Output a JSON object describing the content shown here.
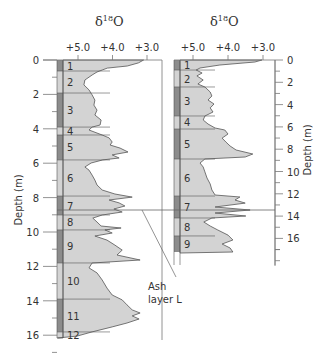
{
  "chart_data": [
    {
      "type": "area",
      "title": "δ18O",
      "xlabel": "δ18O",
      "ylabel": "Depth (m)",
      "x_ticks": [
        "+5.0",
        "+4.0",
        "+3.0"
      ],
      "y_ticks": [
        "0",
        "2",
        "4",
        "6",
        "8",
        "10",
        "12",
        "14",
        "16"
      ],
      "ylim": [
        0,
        16.2
      ],
      "zones": [
        {
          "label": "1",
          "top": 0,
          "bottom": 0.64,
          "dark": true
        },
        {
          "label": "2",
          "top": 0.64,
          "bottom": 1.92,
          "dark": false
        },
        {
          "label": "3",
          "top": 1.92,
          "bottom": 3.9,
          "dark": true
        },
        {
          "label": "4",
          "top": 3.9,
          "bottom": 4.36,
          "dark": false
        },
        {
          "label": "5",
          "top": 4.36,
          "bottom": 5.81,
          "dark": true
        },
        {
          "label": "6",
          "top": 5.81,
          "bottom": 7.91,
          "dark": false
        },
        {
          "label": "7",
          "top": 7.91,
          "bottom": 9.01,
          "dark": true
        },
        {
          "label": "8",
          "top": 9.01,
          "bottom": 9.88,
          "dark": false
        },
        {
          "label": "9",
          "top": 9.88,
          "bottom": 11.8,
          "dark": true
        },
        {
          "label": "10",
          "top": 11.8,
          "bottom": 13.9,
          "dark": false
        },
        {
          "label": "11",
          "top": 13.9,
          "bottom": 15.81,
          "dark": true
        },
        {
          "label": "12",
          "top": 15.81,
          "bottom": 16.16,
          "dark": false
        }
      ],
      "series": [
        {
          "name": "δ18O left core",
          "points": [
            [
              0,
              3.1
            ],
            [
              0.17,
              3.25
            ],
            [
              0.35,
              3.57
            ],
            [
              0.47,
              4.15
            ],
            [
              0.58,
              4.3
            ],
            [
              0.7,
              4.45
            ],
            [
              0.87,
              4.59
            ],
            [
              1.16,
              4.8
            ],
            [
              1.45,
              4.83
            ],
            [
              1.74,
              4.68
            ],
            [
              2.03,
              4.59
            ],
            [
              2.33,
              4.51
            ],
            [
              2.62,
              4.54
            ],
            [
              2.91,
              4.45
            ],
            [
              3.2,
              4.51
            ],
            [
              3.49,
              4.33
            ],
            [
              3.78,
              4.36
            ],
            [
              3.9,
              4.59
            ],
            [
              4.07,
              4.68
            ],
            [
              4.36,
              4.3
            ],
            [
              4.53,
              4.1
            ],
            [
              4.77,
              4.01
            ],
            [
              4.94,
              4.07
            ],
            [
              5.12,
              3.78
            ],
            [
              5.35,
              3.55
            ],
            [
              5.52,
              4.01
            ],
            [
              5.7,
              3.81
            ],
            [
              5.81,
              4.28
            ],
            [
              5.99,
              4.62
            ],
            [
              6.22,
              4.8
            ],
            [
              6.4,
              4.68
            ],
            [
              6.69,
              4.59
            ],
            [
              6.98,
              4.51
            ],
            [
              7.27,
              4.45
            ],
            [
              7.56,
              4.3
            ],
            [
              7.79,
              3.93
            ],
            [
              7.97,
              3.43
            ],
            [
              8.14,
              4.1
            ],
            [
              8.31,
              3.81
            ],
            [
              8.49,
              3.64
            ],
            [
              8.66,
              3.96
            ],
            [
              8.84,
              3.72
            ],
            [
              9.01,
              4.3
            ],
            [
              9.19,
              4.57
            ],
            [
              9.42,
              4.45
            ],
            [
              9.65,
              4.33
            ],
            [
              9.77,
              3.75
            ],
            [
              9.88,
              4.22
            ],
            [
              10.06,
              4.01
            ],
            [
              10.23,
              4.51
            ],
            [
              10.47,
              4.16
            ],
            [
              10.76,
              3.93
            ],
            [
              11.05,
              3.72
            ],
            [
              11.34,
              3.87
            ],
            [
              11.63,
              3.2
            ],
            [
              11.8,
              4.59
            ],
            [
              12.09,
              4.68
            ],
            [
              12.38,
              4.45
            ],
            [
              12.79,
              4.3
            ],
            [
              13.26,
              4.16
            ],
            [
              13.66,
              4.01
            ],
            [
              13.95,
              3.72
            ],
            [
              14.24,
              3.58
            ],
            [
              14.53,
              3.43
            ],
            [
              14.71,
              3.2
            ],
            [
              14.88,
              3.43
            ],
            [
              15.06,
              3.23
            ],
            [
              15.29,
              3.58
            ],
            [
              15.52,
              4.01
            ],
            [
              15.81,
              4.59
            ],
            [
              16.05,
              5.03
            ],
            [
              16.16,
              5.6
            ]
          ]
        }
      ]
    },
    {
      "type": "area",
      "title": "δ18O",
      "xlabel": "δ18O",
      "ylabel": "Depth (m)",
      "x_ticks": [
        "+5.0",
        "+4.0",
        "+3.0"
      ],
      "y_ticks": [
        "0",
        "2",
        "4",
        "6",
        "8",
        "10",
        "12",
        "14",
        "16"
      ],
      "ylim": [
        0,
        18.4
      ],
      "zones": [
        {
          "label": "1",
          "top": 0,
          "bottom": 0.9,
          "dark": true
        },
        {
          "label": "2",
          "top": 0.9,
          "bottom": 2.42,
          "dark": false
        },
        {
          "label": "3",
          "top": 2.42,
          "bottom": 5.02,
          "dark": true
        },
        {
          "label": "4",
          "top": 5.02,
          "bottom": 6.19,
          "dark": false
        },
        {
          "label": "5",
          "top": 6.19,
          "bottom": 8.88,
          "dark": true
        },
        {
          "label": "6",
          "top": 8.88,
          "bottom": 12.2,
          "dark": false
        },
        {
          "label": "7",
          "top": 12.2,
          "bottom": 14.17,
          "dark": true
        },
        {
          "label": "8",
          "top": 14.17,
          "bottom": 15.78,
          "dark": false
        },
        {
          "label": "9",
          "top": 15.78,
          "bottom": 17.22,
          "dark": true
        }
      ],
      "series": [
        {
          "name": "δ18O right core",
          "points": [
            [
              0,
              3.03
            ],
            [
              0.18,
              3.23
            ],
            [
              0.45,
              4.23
            ],
            [
              0.72,
              4.8
            ],
            [
              0.9,
              4.91
            ],
            [
              1.17,
              4.74
            ],
            [
              1.43,
              4.89
            ],
            [
              1.79,
              4.71
            ],
            [
              2.15,
              4.86
            ],
            [
              2.42,
              4.66
            ],
            [
              2.87,
              4.51
            ],
            [
              3.23,
              4.46
            ],
            [
              3.59,
              4.57
            ],
            [
              3.95,
              4.4
            ],
            [
              4.3,
              4.51
            ],
            [
              4.66,
              4.43
            ],
            [
              5.02,
              4.66
            ],
            [
              5.38,
              4.71
            ],
            [
              5.74,
              4.57
            ],
            [
              6.1,
              4.37
            ],
            [
              6.28,
              4.09
            ],
            [
              6.64,
              4.0
            ],
            [
              7.0,
              4.17
            ],
            [
              7.35,
              4.06
            ],
            [
              7.71,
              3.94
            ],
            [
              8.07,
              3.77
            ],
            [
              8.43,
              3.29
            ],
            [
              8.7,
              3.51
            ],
            [
              8.88,
              4.66
            ],
            [
              9.24,
              4.8
            ],
            [
              9.6,
              4.71
            ],
            [
              10.04,
              4.66
            ],
            [
              10.58,
              4.6
            ],
            [
              11.12,
              4.51
            ],
            [
              11.66,
              4.46
            ],
            [
              12.11,
              4.37
            ],
            [
              12.29,
              3.66
            ],
            [
              12.56,
              3.8
            ],
            [
              12.83,
              3.51
            ],
            [
              13.18,
              4.37
            ],
            [
              13.45,
              3.37
            ],
            [
              13.72,
              4.37
            ],
            [
              13.99,
              3.49
            ],
            [
              14.17,
              4.46
            ],
            [
              14.53,
              4.69
            ],
            [
              14.89,
              4.51
            ],
            [
              15.25,
              4.29
            ],
            [
              15.7,
              4.0
            ],
            [
              16.14,
              3.86
            ],
            [
              16.5,
              4.17
            ],
            [
              16.86,
              3.94
            ],
            [
              17.22,
              3.86
            ],
            [
              17.31,
              5.37
            ]
          ]
        }
      ]
    }
  ],
  "left_panel": {
    "title_main": "δ",
    "title_sup": "18",
    "title_end": "O",
    "x_ticks": [
      "+5.0",
      "+4.0",
      "+3.0"
    ],
    "y_ticks": [
      "0",
      "2",
      "4",
      "6",
      "8",
      "10",
      "12",
      "14",
      "16"
    ],
    "ylabel": "Depth (m)"
  },
  "right_panel": {
    "title_main": "δ",
    "title_sup": "18",
    "title_end": "O",
    "x_ticks": [
      "+5.0",
      "+4.0",
      "+3.0"
    ],
    "y_ticks": [
      "0",
      "2",
      "4",
      "6",
      "8",
      "10",
      "12",
      "14",
      "16"
    ],
    "ylabel": "Depth (m)"
  },
  "annotation": {
    "line1": "Ash",
    "line2": "layer L"
  },
  "colors": {
    "fill": "#d3d3d3",
    "strip": "#8c8c8c",
    "line": "#555555",
    "frame": "#777777"
  }
}
